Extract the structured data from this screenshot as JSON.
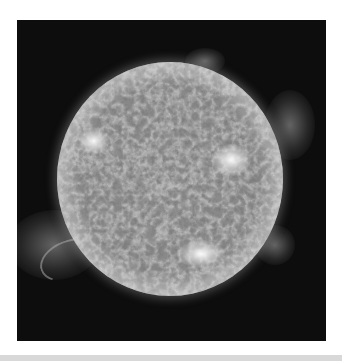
{
  "image": {
    "subject": "Sun in extreme ultraviolet light",
    "features": [
      "solar-disk",
      "active-regions",
      "prominences",
      "corona"
    ],
    "colors": {
      "background": "#ffffff",
      "frame": "#0d0d0d",
      "disk": "#8e8e8e",
      "bright_region": "#ffffff",
      "bottom_band": "#d8d8d8"
    }
  }
}
